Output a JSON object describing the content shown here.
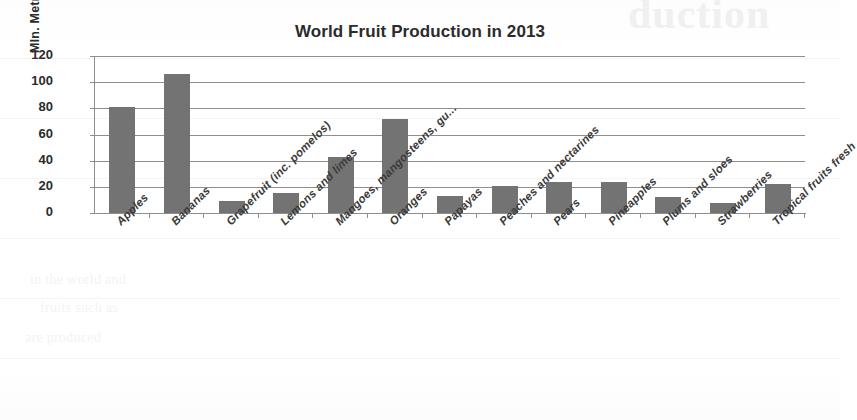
{
  "chart_data": {
    "type": "bar",
    "title": "World Fruit Production in 2013",
    "xlabel": "",
    "ylabel": "Mln. Metric Tonnes",
    "ylim": [
      0,
      120
    ],
    "yticks": [
      0,
      20,
      40,
      60,
      80,
      100,
      120
    ],
    "grid": true,
    "legend": false,
    "bar_color": "#737373",
    "grid_color": "#8e8e8e",
    "categories": [
      "Apples",
      "Bananas",
      "Grapefruit (inc. pomelos)",
      "Lemons and limes",
      "Mangoes, mangosteens, gu...",
      "Oranges",
      "Papayas",
      "Peaches and nectarines",
      "Pears",
      "Pineapples",
      "Plums and sloes",
      "Strawberries",
      "Tropical fruits fresh"
    ],
    "values": [
      81,
      106,
      9,
      15,
      43,
      72,
      13,
      21,
      24,
      24,
      12,
      8,
      22
    ]
  },
  "scan": {
    "ghost_title": "duction",
    "ghost_lines": [
      "in the world and",
      "fruits such as",
      "are produced"
    ]
  }
}
